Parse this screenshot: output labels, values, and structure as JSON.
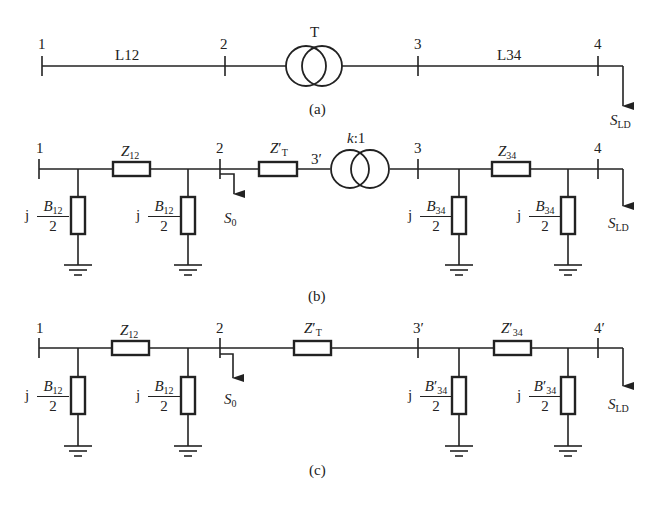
{
  "figure": {
    "a": {
      "caption": "(a)",
      "nodes": [
        "1",
        "2",
        "3",
        "4"
      ],
      "lines": [
        "L12",
        "L34"
      ],
      "transformer": "T",
      "load": {
        "symbol": "S",
        "sub": "LD"
      }
    },
    "b": {
      "caption": "(b)",
      "nodes": [
        "1",
        "2",
        "3′",
        "3",
        "4"
      ],
      "series": [
        {
          "symbol": "Z",
          "sub": "12",
          "prime": ""
        },
        {
          "symbol": "Z",
          "sub": "T",
          "prime": "′"
        },
        {
          "symbol": "Z",
          "sub": "34",
          "prime": ""
        }
      ],
      "ratio": {
        "k": "k",
        "rest": ":1"
      },
      "shunts": [
        {
          "j": "j",
          "num": "B",
          "sub": "12",
          "prime": "",
          "den": "2"
        },
        {
          "j": "j",
          "num": "B",
          "sub": "12",
          "prime": "",
          "den": "2"
        },
        {
          "j": "j",
          "num": "B",
          "sub": "34",
          "prime": "",
          "den": "2"
        },
        {
          "j": "j",
          "num": "B",
          "sub": "34",
          "prime": "",
          "den": "2"
        }
      ],
      "injection": {
        "symbol": "S",
        "sub": "0"
      },
      "load": {
        "symbol": "S",
        "sub": "LD"
      }
    },
    "c": {
      "caption": "(c)",
      "nodes": [
        "1",
        "2",
        "3′",
        "4′"
      ],
      "series": [
        {
          "symbol": "Z",
          "sub": "12",
          "prime": ""
        },
        {
          "symbol": "Z",
          "sub": "T",
          "prime": "′"
        },
        {
          "symbol": "Z",
          "sub": "34",
          "prime": "′"
        }
      ],
      "shunts": [
        {
          "j": "j",
          "num": "B",
          "sub": "12",
          "prime": "",
          "den": "2"
        },
        {
          "j": "j",
          "num": "B",
          "sub": "12",
          "prime": "",
          "den": "2"
        },
        {
          "j": "j",
          "num": "B",
          "sub": "34",
          "prime": "′",
          "den": "2"
        },
        {
          "j": "j",
          "num": "B",
          "sub": "34",
          "prime": "′",
          "den": "2"
        }
      ],
      "injection": {
        "symbol": "S",
        "sub": "0"
      },
      "load": {
        "symbol": "S",
        "sub": "LD"
      }
    }
  }
}
